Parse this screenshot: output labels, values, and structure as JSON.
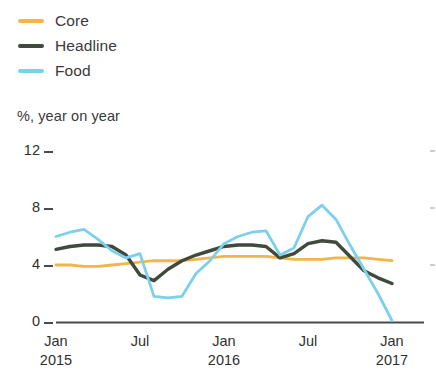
{
  "legend": {
    "position": "top-left",
    "items": [
      {
        "label": "Core",
        "color": "#f0b64a",
        "key": "core"
      },
      {
        "label": "Headline",
        "color": "#3f4a3c",
        "key": "headline"
      },
      {
        "label": "Food",
        "color": "#7cd0ee",
        "key": "food"
      }
    ]
  },
  "axis": {
    "subtitle": "%, year on year",
    "y_ticks": [
      "12",
      "8",
      "4",
      "0"
    ],
    "x_ticks": [
      {
        "line1": "Jan",
        "line2": "2015"
      },
      {
        "line1": "Jul",
        "line2": ""
      },
      {
        "line1": "Jan",
        "line2": "2016"
      },
      {
        "line1": "Jul",
        "line2": ""
      },
      {
        "line1": "Jan",
        "line2": "2017"
      }
    ]
  },
  "chart_data": {
    "type": "line",
    "title": "",
    "subtitle": "%, year on year",
    "xlabel": "",
    "ylabel": "%, year on year",
    "ylim": [
      0,
      12
    ],
    "yticks": [
      0,
      4,
      8,
      12
    ],
    "grid": false,
    "legend_position": "top-left",
    "x": [
      "Jan 2015",
      "Feb 2015",
      "Mar 2015",
      "Apr 2015",
      "May 2015",
      "Jun 2015",
      "Jul 2015",
      "Aug 2015",
      "Sep 2015",
      "Oct 2015",
      "Nov 2015",
      "Dec 2015",
      "Jan 2016",
      "Feb 2016",
      "Mar 2016",
      "Apr 2016",
      "May 2016",
      "Jun 2016",
      "Jul 2016",
      "Aug 2016",
      "Sep 2016",
      "Oct 2016",
      "Nov 2016",
      "Dec 2016",
      "Jan 2017"
    ],
    "xtick_labels": [
      "Jan 2015",
      "Jul",
      "Jan 2016",
      "Jul",
      "Jan 2017"
    ],
    "xtick_indices": [
      0,
      6,
      12,
      18,
      24
    ],
    "series": [
      {
        "name": "Core",
        "color": "#f0b64a",
        "values": [
          4.0,
          4.0,
          3.9,
          3.9,
          4.0,
          4.1,
          4.2,
          4.3,
          4.3,
          4.3,
          4.4,
          4.5,
          4.6,
          4.6,
          4.6,
          4.6,
          4.5,
          4.4,
          4.4,
          4.4,
          4.5,
          4.5,
          4.5,
          4.4,
          4.3
        ]
      },
      {
        "name": "Headline",
        "color": "#3f4a3c",
        "values": [
          5.1,
          5.3,
          5.4,
          5.4,
          5.3,
          4.7,
          3.3,
          2.9,
          3.7,
          4.3,
          4.7,
          5.0,
          5.3,
          5.4,
          5.4,
          5.3,
          4.5,
          4.8,
          5.5,
          5.7,
          5.6,
          4.6,
          3.6,
          3.1,
          2.7
        ]
      },
      {
        "name": "Food",
        "color": "#7cd0ee",
        "values": [
          6.0,
          6.3,
          6.5,
          5.8,
          5.0,
          4.5,
          4.8,
          1.8,
          1.7,
          1.8,
          3.4,
          4.3,
          5.5,
          6.0,
          6.3,
          6.4,
          4.7,
          5.2,
          7.4,
          8.2,
          7.2,
          5.4,
          3.7,
          2.0,
          0.1
        ]
      }
    ]
  }
}
